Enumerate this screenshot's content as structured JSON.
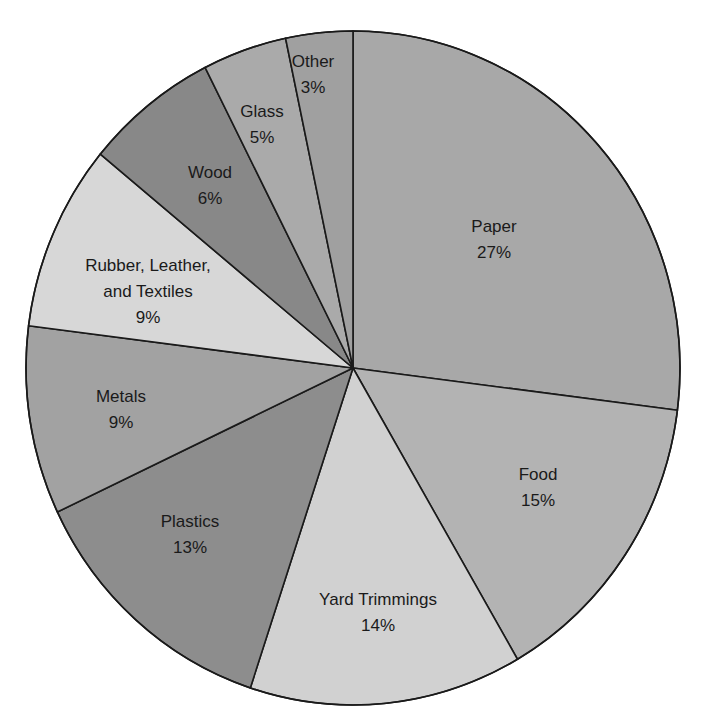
{
  "chart_data": {
    "type": "pie",
    "title": "",
    "start_angle_deg": 0,
    "direction": "clockwise",
    "center": [
      353,
      368
    ],
    "radius_x": 327,
    "radius_y": 337,
    "stroke_color": "#1a1a1a",
    "slices": [
      {
        "label": "Paper",
        "lines": [
          "Paper"
        ],
        "value": 27,
        "value_label": "27%",
        "color": "#a8a8a8",
        "start": 0,
        "end": 97.2,
        "label_pos": [
          494,
          214
        ]
      },
      {
        "label": "Food",
        "lines": [
          "Food"
        ],
        "value": 15,
        "value_label": "15%",
        "color": "#b3b3b3",
        "start": 97.2,
        "end": 149.8,
        "label_pos": [
          538,
          462
        ]
      },
      {
        "label": "Yard Trimmings",
        "lines": [
          "Yard Trimmings"
        ],
        "value": 14,
        "value_label": "14%",
        "color": "#d1d1d1",
        "start": 149.8,
        "end": 198.3,
        "label_pos": [
          378,
          587
        ]
      },
      {
        "label": "Plastics",
        "lines": [
          "Plastics"
        ],
        "value": 13,
        "value_label": "13%",
        "color": "#8d8d8d",
        "start": 198.3,
        "end": 244.7,
        "label_pos": [
          190,
          509
        ]
      },
      {
        "label": "Metals",
        "lines": [
          "Metals"
        ],
        "value": 9,
        "value_label": "9%",
        "color": "#a2a2a2",
        "start": 244.7,
        "end": 277.2,
        "label_pos": [
          121,
          384
        ]
      },
      {
        "label": "Rubber, Leather, and Textiles",
        "lines": [
          "Rubber, Leather,",
          "and Textiles"
        ],
        "value": 9,
        "value_label": "9%",
        "color": "#d7d7d7",
        "start": 277.2,
        "end": 309.4,
        "label_pos": [
          148,
          253
        ]
      },
      {
        "label": "Wood",
        "lines": [
          "Wood"
        ],
        "value": 6,
        "value_label": "6%",
        "color": "#888888",
        "start": 309.4,
        "end": 333.1,
        "label_pos": [
          210,
          160
        ]
      },
      {
        "label": "Glass",
        "lines": [
          "Glass"
        ],
        "value": 5,
        "value_label": "5%",
        "color": "#aaaaaa",
        "start": 333.1,
        "end": 348.1,
        "label_pos": [
          262,
          99
        ]
      },
      {
        "label": "Other",
        "lines": [
          "Other"
        ],
        "value": 3,
        "value_label": "3%",
        "color": "#a0a0a0",
        "start": 348.1,
        "end": 360,
        "label_pos": [
          313,
          49
        ]
      }
    ],
    "categories": [
      "Paper",
      "Food",
      "Yard Trimmings",
      "Plastics",
      "Metals",
      "Rubber, Leather, and Textiles",
      "Wood",
      "Glass",
      "Other"
    ],
    "values": [
      27,
      15,
      14,
      13,
      9,
      9,
      6,
      5,
      3
    ],
    "legend": "none (labels placed inside slices)"
  }
}
